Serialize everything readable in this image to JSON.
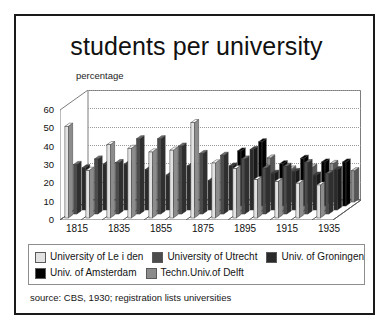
{
  "frame": {
    "border_color": "#1a1a1a"
  },
  "title": "students per university",
  "source": "source: CBS, 1930; registration lists universities",
  "legend": {
    "rows": [
      [
        {
          "label": "University of Le i den",
          "color": "#e2e2e2"
        },
        {
          "label": "University of Utrecht",
          "color": "#4c4c4c"
        },
        {
          "label": "Univ. of Groningen",
          "color": "#2a2a2a"
        }
      ],
      [
        {
          "label": "Univ. of Amsterdam",
          "color": "#000000"
        },
        {
          "label": "Techn.Univ.of Delft",
          "color": "#8c8c8c"
        }
      ]
    ]
  },
  "chart_data": {
    "type": "bar",
    "title": "students per university",
    "subtitle": "",
    "xlabel": "",
    "ylabel": "percentage",
    "ylim": [
      0,
      60
    ],
    "yticks": [
      0,
      10,
      20,
      30,
      40,
      50,
      60
    ],
    "grid": true,
    "legend_position": "bottom",
    "projection": "3d-grouped-columns",
    "categories": [
      "1815",
      "1825",
      "1835",
      "1845",
      "1855",
      "1865",
      "1875",
      "1885",
      "1895",
      "1905",
      "1915",
      "1925",
      "1935"
    ],
    "tick_labels_shown": [
      "1815",
      "1835",
      "1855",
      "1875",
      "1895",
      "1915",
      "1935"
    ],
    "series": [
      {
        "name": "University of Le i den",
        "color": "#e2e2e2",
        "values": [
          50,
          26,
          40,
          38,
          36,
          37,
          52,
          30,
          27,
          21,
          20,
          19,
          18
        ]
      },
      {
        "name": "University of Utrecht",
        "color": "#4c4c4c",
        "values": [
          27,
          30,
          28,
          41,
          41,
          37,
          33,
          32,
          30,
          25,
          26,
          28,
          22
        ]
      },
      {
        "name": "Univ. of Groningen",
        "color": "#2a2a2a",
        "values": [
          23,
          25,
          25,
          22,
          19,
          24,
          16,
          24,
          33,
          20,
          21,
          19,
          22
        ]
      },
      {
        "name": "Univ. of Amsterdam",
        "color": "#000000",
        "values": [
          0,
          0,
          0,
          0,
          0,
          0,
          0,
          30,
          35,
          23,
          26,
          24,
          24
        ]
      },
      {
        "name": "Techn.Univ.of Delft",
        "color": "#8c8c8c",
        "values": [
          0,
          0,
          0,
          0,
          0,
          0,
          0,
          0,
          24,
          18,
          19,
          21,
          17
        ]
      }
    ]
  }
}
